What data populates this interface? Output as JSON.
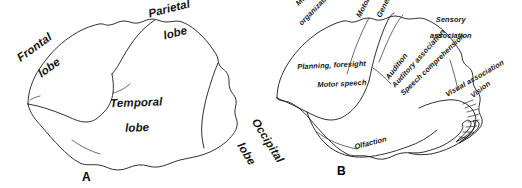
{
  "figure": {
    "background_color": "#ffffff",
    "ink_color": "#1a1a1a"
  },
  "panels": [
    {
      "letter": "A",
      "caption_position": "bottom-center",
      "kind": "lobes",
      "labels": [
        {
          "name": "frontal-lobe",
          "text": "Frontal\nlobe",
          "lines": [
            "Frontal",
            "lobe"
          ],
          "x": 28,
          "y": 75,
          "rotation": -36,
          "font_size": 11.5
        },
        {
          "name": "parietal-lobe",
          "text": "Parietal\nlobe",
          "lines": [
            "Parietal",
            "lobe"
          ],
          "x": 140,
          "y": 30,
          "rotation": -14,
          "font_size": 11.5
        },
        {
          "name": "temporal-lobe",
          "text": "Temporal\nlobe",
          "lines": [
            "Temporal",
            "lobe"
          ],
          "x": 92,
          "y": 117,
          "rotation": -2,
          "font_size": 11.5
        },
        {
          "name": "occipital-lobe",
          "text": "Occipital\nlobe",
          "lines": [
            "Occipital",
            "lobe"
          ],
          "x": 207,
          "y": 95,
          "rotation": 58,
          "font_size": 11.5
        }
      ]
    },
    {
      "letter": "B",
      "caption_position": "bottom-center",
      "kind": "functional-areas",
      "labels": [
        {
          "name": "motor-organization",
          "text": "Motor\norganization",
          "lines": [
            "Motor",
            "organization"
          ],
          "x": 39,
          "y": 22,
          "rotation": -46,
          "font_size": 7.4
        },
        {
          "name": "motor",
          "text": "Motor",
          "lines": [
            "Motor"
          ],
          "x": 102,
          "y": 22,
          "rotation": -62,
          "font_size": 7.4
        },
        {
          "name": "general-sensation",
          "text": "General sensation",
          "lines": [
            "General sensation"
          ],
          "x": 123,
          "y": 22,
          "rotation": -64,
          "font_size": 7.4
        },
        {
          "name": "sensory-association",
          "text": "Sensory\nassociation",
          "lines": [
            "Sensory",
            "association"
          ],
          "x": 156,
          "y": 28,
          "rotation": 0,
          "font_size": 7.6
        },
        {
          "name": "planning-foresight",
          "text": "Planning, foresight",
          "lines": [
            "Planning, foresight"
          ],
          "x": 24,
          "y": 68,
          "rotation": -3,
          "font_size": 7.4
        },
        {
          "name": "motor-speech",
          "text": "Motor speech",
          "lines": [
            "Motor speech"
          ],
          "x": 44,
          "y": 86,
          "rotation": -3,
          "font_size": 7.4
        },
        {
          "name": "audition",
          "text": "Audition",
          "lines": [
            "Audition"
          ],
          "x": 128,
          "y": 84,
          "rotation": -52,
          "font_size": 7.4
        },
        {
          "name": "auditory-association",
          "text": "Auditory association",
          "lines": [
            "Auditory association"
          ],
          "x": 133,
          "y": 92,
          "rotation": -48,
          "font_size": 7.4
        },
        {
          "name": "speech-comprehension",
          "text": "Speech comprehension",
          "lines": [
            "Speech comprehension"
          ],
          "x": 140,
          "y": 100,
          "rotation": -44,
          "font_size": 7.4
        },
        {
          "name": "visual-association",
          "text": "Visual association",
          "lines": [
            "Visual association"
          ],
          "x": 180,
          "y": 100,
          "rotation": -30,
          "font_size": 7.4
        },
        {
          "name": "vision",
          "text": "Vision",
          "lines": [
            "Vision"
          ],
          "x": 208,
          "y": 102,
          "rotation": -38,
          "font_size": 7.4
        },
        {
          "name": "olfaction",
          "text": "Olfaction",
          "lines": [
            "Olfaction"
          ],
          "x": 84,
          "y": 150,
          "rotation": -14,
          "font_size": 7.4
        }
      ]
    }
  ]
}
